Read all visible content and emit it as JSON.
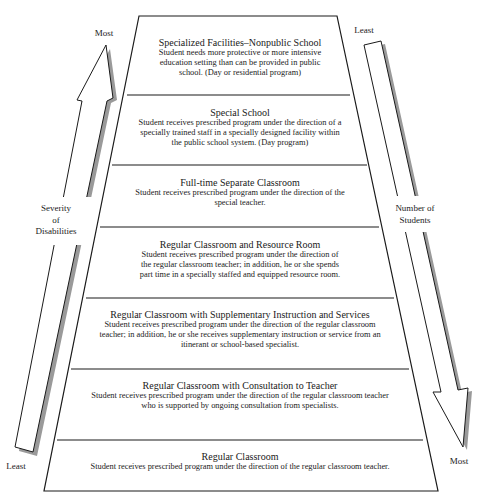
{
  "diagram": {
    "levels": [
      {
        "title": "Specialized Facilities–Nonpublic School",
        "lines": [
          "Student needs more protective or more intensive",
          "education setting than can be provided in public",
          "school. (Day or residential program)"
        ]
      },
      {
        "title": "Special School",
        "lines": [
          "Student receives prescribed program under the direction of a",
          "specially trained staff in a specially designed facility within",
          "the public school system. (Day program)"
        ]
      },
      {
        "title": "Full-time Separate Classroom",
        "lines": [
          "Student receives prescribed program under the direction of the",
          "special teacher."
        ]
      },
      {
        "title": "Regular Classroom and Resource Room",
        "lines": [
          "Student receives prescribed program under the direction of",
          "the regular classroom teacher; in addition, he or she spends",
          "part time in a specially staffed and equipped resource room."
        ]
      },
      {
        "title": "Regular Classroom with Supplementary Instruction and Services",
        "lines": [
          "Student receives prescribed program under the direction of the regular classroom",
          "teacher; in addition, he or she receives supplementary instruction or service from an",
          "itinerant or school-based specialist."
        ]
      },
      {
        "title": "Regular Classroom with Consultation to Teacher",
        "lines": [
          "Student receives prescribed program under the direction of the regular classroom teacher",
          "who is supported by ongoing consultation from specialists."
        ]
      },
      {
        "title": "Regular Classroom",
        "lines": [
          "Student receives prescribed program under the direction of the regular classroom teacher."
        ]
      }
    ],
    "left_axis": {
      "top_label": "Most",
      "bottom_label": "Least",
      "label_lines": [
        "Severity",
        "of",
        "Disabilities"
      ]
    },
    "right_axis": {
      "top_label": "Least",
      "bottom_label": "Most",
      "label_lines": [
        "Number of",
        "Students"
      ]
    },
    "colors": {
      "stroke": "#1a1a1a",
      "shadow": "#9a9a9a",
      "background": "#ffffff"
    }
  }
}
